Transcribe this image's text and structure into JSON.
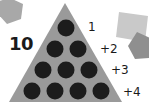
{
  "total": "10",
  "colors": {
    "background": "#ffffff",
    "triangle": "#9a9a9a",
    "dot": "#1c1c1c",
    "text": "#1a1a1a",
    "shape_light": "#c8c8c8",
    "shape_mid": "#a8a8a8",
    "shape_dark": "#8c8c8c"
  },
  "rows": [
    {
      "label": "1",
      "dots": 1
    },
    {
      "label": "+2",
      "dots": 2
    },
    {
      "label": "+3",
      "dots": 3
    },
    {
      "label": "+4",
      "dots": 4
    }
  ],
  "decorations": [
    {
      "shape": "pentagon",
      "position": "top-left"
    },
    {
      "shape": "square",
      "position": "top-right"
    },
    {
      "shape": "pentagon",
      "position": "right"
    }
  ]
}
